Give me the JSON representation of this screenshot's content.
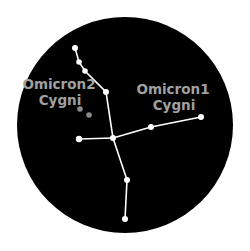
{
  "diagram": {
    "title": "",
    "background_color": "#000000",
    "line_color": "#ffffff",
    "star_color": "#ffffff",
    "faint_star_color": "#8a8a8a",
    "label_color": "#a0a0a0",
    "labels": [
      {
        "id": "omicron2",
        "line1": "Omicron2",
        "line2": "Cygni"
      },
      {
        "id": "omicron1",
        "line1": "Omicron1",
        "line2": "Cygni"
      }
    ],
    "stars": [
      {
        "id": "a",
        "x": 75,
        "y": 48
      },
      {
        "id": "b",
        "x": 79,
        "y": 62
      },
      {
        "id": "c",
        "x": 85,
        "y": 71
      },
      {
        "id": "d",
        "x": 106,
        "y": 92
      },
      {
        "id": "center",
        "x": 113,
        "y": 138
      },
      {
        "id": "left",
        "x": 79,
        "y": 139
      },
      {
        "id": "g",
        "x": 151,
        "y": 127
      },
      {
        "id": "h",
        "x": 201,
        "y": 117
      },
      {
        "id": "i",
        "x": 127,
        "y": 180
      },
      {
        "id": "j",
        "x": 125,
        "y": 219
      }
    ],
    "faint_stars": [
      {
        "id": "omicron2-a",
        "x": 80,
        "y": 109
      },
      {
        "id": "omicron2-b",
        "x": 89,
        "y": 115
      }
    ]
  }
}
